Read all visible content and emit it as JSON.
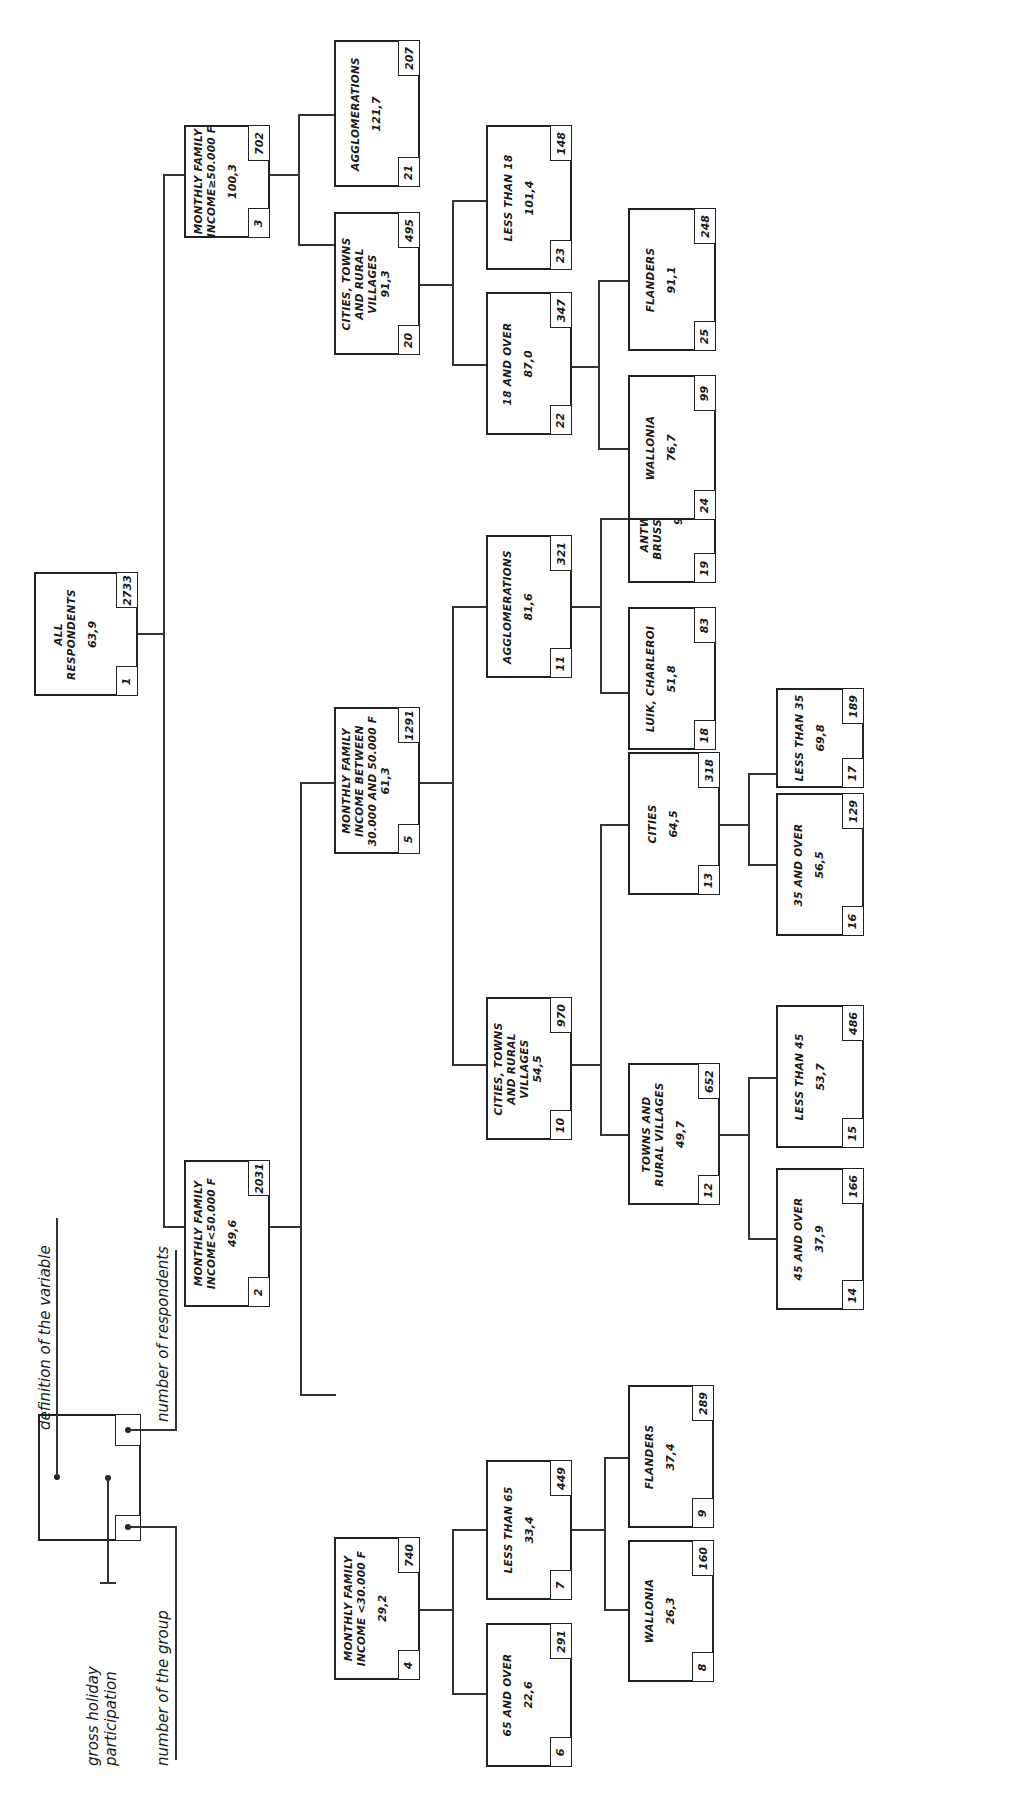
{
  "legend": {
    "definition": "definition of the variable",
    "respondents": "number of respondents",
    "participation_line1": "gross holiday",
    "participation_line2": "participation",
    "group": "number of the group"
  },
  "nodes": [
    {
      "id": "1",
      "label": [
        "ALL",
        "RESPONDENTS"
      ],
      "value": "63,9",
      "n": "2733"
    },
    {
      "id": "2",
      "label": [
        "MONTHLY FAMILY",
        "INCOME<50.000 F"
      ],
      "value": "49,6",
      "n": "2031"
    },
    {
      "id": "3",
      "label": [
        "MONTHLY FAMILY",
        "INCOME≥50.000 F"
      ],
      "value": "100,3",
      "n": "702"
    },
    {
      "id": "4",
      "label": [
        "MONTHLY FAMILY",
        "INCOME <30.000 F"
      ],
      "value": "29,2",
      "n": "740"
    },
    {
      "id": "5",
      "label": [
        "MONTHLY FAMILY",
        "INCOME BETWEEN",
        "30.000 AND 50.000 F"
      ],
      "value": "61,3",
      "n": "1291"
    },
    {
      "id": "6",
      "label": [
        "65 AND OVER"
      ],
      "value": "22,6",
      "n": "291"
    },
    {
      "id": "7",
      "label": [
        "LESS THAN 65"
      ],
      "value": "33,4",
      "n": "449"
    },
    {
      "id": "8",
      "label": [
        "WALLONIA"
      ],
      "value": "26,3",
      "n": "160"
    },
    {
      "id": "9",
      "label": [
        "FLANDERS"
      ],
      "value": "37,4",
      "n": "289"
    },
    {
      "id": "10",
      "label": [
        "CITIES, TOWNS",
        "AND RURAL",
        "VILLAGES"
      ],
      "value": "54,5",
      "n": "970"
    },
    {
      "id": "11",
      "label": [
        "AGGLOMERATIONS"
      ],
      "value": "81,6",
      "n": "321"
    },
    {
      "id": "12",
      "label": [
        "TOWNS AND",
        "RURAL VILLAGES"
      ],
      "value": "49,7",
      "n": "652"
    },
    {
      "id": "13",
      "label": [
        "CITIES"
      ],
      "value": "64,5",
      "n": "318"
    },
    {
      "id": "14",
      "label": [
        "45 AND OVER"
      ],
      "value": "37,9",
      "n": "166"
    },
    {
      "id": "15",
      "label": [
        "LESS THAN 45"
      ],
      "value": "53,7",
      "n": "486"
    },
    {
      "id": "16",
      "label": [
        "35 AND OVER"
      ],
      "value": "56,5",
      "n": "129"
    },
    {
      "id": "17",
      "label": [
        "LESS THAN 35"
      ],
      "value": "69,8",
      "n": "189"
    },
    {
      "id": "18",
      "label": [
        "LUIK, CHARLEROI"
      ],
      "value": "51,8",
      "n": "83"
    },
    {
      "id": "19",
      "label": [
        "ANTWERPEN,",
        "BRUSSEL, GENT"
      ],
      "value": "92,0",
      "n": "238"
    },
    {
      "id": "20",
      "label": [
        "CITIES, TOWNS",
        "AND RURAL",
        "VILLAGES"
      ],
      "value": "91,3",
      "n": "495"
    },
    {
      "id": "21",
      "label": [
        "AGGLOMERATIONS"
      ],
      "value": "121,7",
      "n": "207"
    },
    {
      "id": "22",
      "label": [
        "18 AND OVER"
      ],
      "value": "87,0",
      "n": "347"
    },
    {
      "id": "23",
      "label": [
        "LESS THAN 18"
      ],
      "value": "101,4",
      "n": "148"
    },
    {
      "id": "24",
      "label": [
        "WALLONIA"
      ],
      "value": "76,7",
      "n": "99"
    },
    {
      "id": "25",
      "label": [
        "FLANDERS"
      ],
      "value": "91,1",
      "n": "248"
    }
  ]
}
